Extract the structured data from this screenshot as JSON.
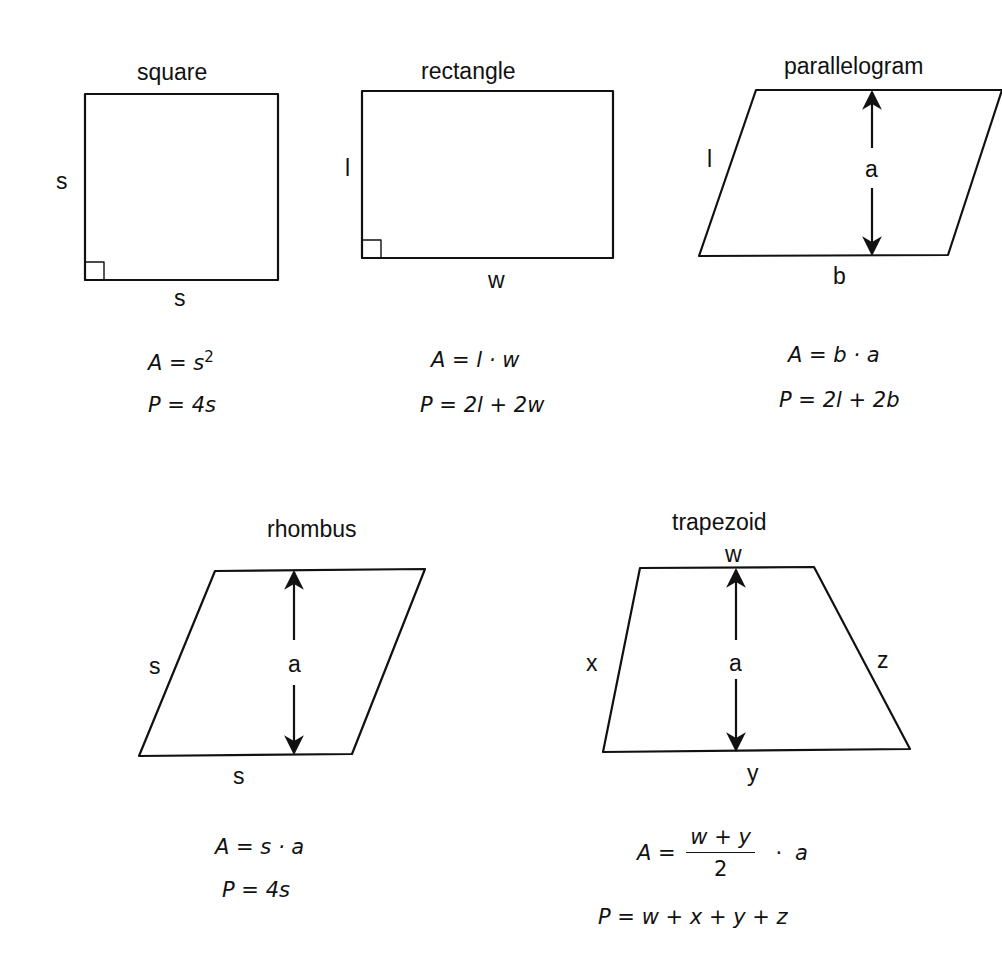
{
  "shapes": {
    "square": {
      "title": "square",
      "side_left": "s",
      "side_bottom": "s",
      "area": {
        "lhs": "A",
        "eq": "=",
        "rhs_base": "s",
        "rhs_exp": "2"
      },
      "perimeter": {
        "lhs": "P",
        "eq": "=",
        "rhs": "4s"
      }
    },
    "rectangle": {
      "title": "rectangle",
      "side_left": "l",
      "side_bottom": "w",
      "area": {
        "lhs": "A",
        "eq": "=",
        "rhs": "l · w"
      },
      "perimeter": {
        "lhs": "P",
        "eq": "=",
        "rhs": "2l + 2w"
      }
    },
    "parallelogram": {
      "title": "parallelogram",
      "side_left": "l",
      "side_bottom": "b",
      "height": "a",
      "area": {
        "lhs": "A",
        "eq": "=",
        "rhs": "b · a"
      },
      "perimeter": {
        "lhs": "P",
        "eq": "=",
        "rhs": "2l + 2b"
      }
    },
    "rhombus": {
      "title": "rhombus",
      "side_left": "s",
      "side_bottom": "s",
      "height": "a",
      "area": {
        "lhs": "A",
        "eq": "=",
        "rhs": "s · a"
      },
      "perimeter": {
        "lhs": "P",
        "eq": "=",
        "rhs": "4s"
      }
    },
    "trapezoid": {
      "title": "trapezoid",
      "side_top": "w",
      "side_left": "x",
      "side_right": "z",
      "side_bottom": "y",
      "height": "a",
      "area": {
        "lhs": "A",
        "eq": "=",
        "numerator": "w + y",
        "denominator": "2",
        "times": "·",
        "factor": "a"
      },
      "perimeter": {
        "lhs": "P",
        "eq": "=",
        "rhs": "w + x + y + z"
      }
    }
  }
}
